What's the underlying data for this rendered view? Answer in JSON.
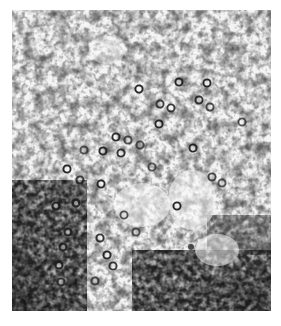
{
  "image": {
    "kind": "electron micrograph",
    "description": "Grayscale transmission electron micrograph showing cross-sections of numerous small ring-shaped (tubular) structures scattered through a granular cytoplasm, with dense dark granular regions at the lower-left and lower-right.",
    "colors": {
      "background": "#ffffff",
      "matrix_light": "#f2f2f2",
      "granule_dark": "#2a2a2a",
      "ring": "#1e1e1e"
    },
    "structures": {
      "ring_profile_count_approx": 35,
      "dense_regions": [
        "lower-left",
        "lower-right"
      ]
    }
  }
}
